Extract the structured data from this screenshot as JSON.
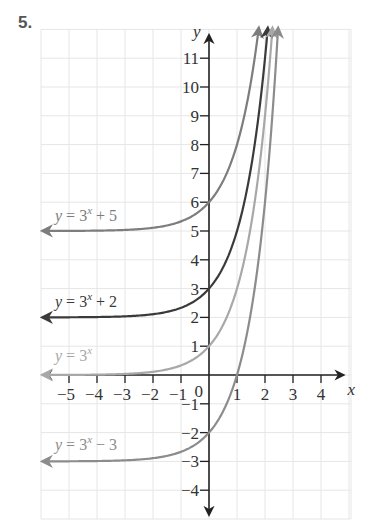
{
  "problem": {
    "number": "5."
  },
  "chart_data": {
    "type": "line",
    "title": "",
    "xlabel": "x",
    "ylabel": "y",
    "xlim": [
      -6,
      5
    ],
    "ylim": [
      -5,
      12
    ],
    "grid": true,
    "x_ticks": [
      -5,
      -4,
      -3,
      -2,
      -1,
      1,
      2,
      3,
      4
    ],
    "y_ticks": [
      -4,
      -3,
      -2,
      -1,
      1,
      2,
      3,
      4,
      5,
      6,
      7,
      8,
      9,
      10,
      11
    ],
    "origin_label": "0",
    "series": [
      {
        "name": "y = 3^x + 5",
        "label_main": "y = 3",
        "label_exp": "x",
        "label_tail": " + 5",
        "base": 3,
        "shift": 5,
        "color": "#7d7d7d",
        "label_pos": [
          -5.5,
          5.35
        ],
        "asymptote": 5
      },
      {
        "name": "y = 3^x + 2",
        "label_main": "y = 3",
        "label_exp": "x",
        "label_tail": " + 2",
        "base": 3,
        "shift": 2,
        "color": "#3a3a3a",
        "label_pos": [
          -5.5,
          2.35
        ],
        "asymptote": 2
      },
      {
        "name": "y = 3^x",
        "label_main": "y = 3",
        "label_exp": "x",
        "label_tail": "",
        "base": 3,
        "shift": 0,
        "color": "#a8a8a8",
        "label_pos": [
          -5.5,
          0.5
        ],
        "asymptote": 0
      },
      {
        "name": "y = 3^x - 3",
        "label_main": "y = 3",
        "label_exp": "x",
        "label_tail": " − 3",
        "base": 3,
        "shift": -3,
        "color": "#8c8c8c",
        "label_pos": [
          -5.5,
          -2.6
        ],
        "asymptote": -3
      }
    ],
    "key_points": [
      {
        "series": "y = 3^x + 5",
        "x": 0,
        "y": 6
      },
      {
        "series": "y = 3^x + 2",
        "x": 0,
        "y": 3
      },
      {
        "series": "y = 3^x",
        "x": 0,
        "y": 1
      },
      {
        "series": "y = 3^x - 3",
        "x": 0,
        "y": -2
      },
      {
        "series": "y = 3^x - 3",
        "x": 1,
        "y": 0
      }
    ]
  }
}
